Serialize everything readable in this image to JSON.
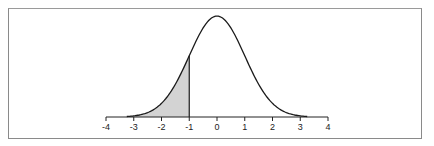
{
  "chart_data": {
    "type": "area",
    "title": "",
    "xlabel": "",
    "ylabel": "",
    "distribution": {
      "name": "standard normal",
      "mean": 0,
      "sd": 1
    },
    "shaded_region": {
      "from": "-inf",
      "to": -1,
      "fill": "#d3d3d3"
    },
    "x_ticks": [
      -4,
      -3,
      -2,
      -1,
      0,
      1,
      2,
      3,
      4
    ],
    "x_tick_labels": [
      "-4",
      "-3",
      "-2",
      "-1",
      "0",
      "1",
      "2",
      "3",
      "4"
    ],
    "xlim": [
      -4,
      4
    ],
    "ylim": [
      0,
      0.4
    ],
    "grid": false,
    "legend": null,
    "x": [
      -3.2,
      -3,
      -2.5,
      -2,
      -1.5,
      -1,
      -0.5,
      0,
      0.5,
      1,
      1.5,
      2,
      2.5,
      3,
      3.2
    ],
    "values": [
      0.0024,
      0.0044,
      0.0175,
      0.054,
      0.1295,
      0.242,
      0.3521,
      0.3989,
      0.3521,
      0.242,
      0.1295,
      0.054,
      0.0175,
      0.0044,
      0.0024
    ]
  },
  "colors": {
    "curve": "#1a1a1a",
    "shade": "#d3d3d3",
    "frame": "#8a8a8a",
    "axis": "#222222"
  }
}
